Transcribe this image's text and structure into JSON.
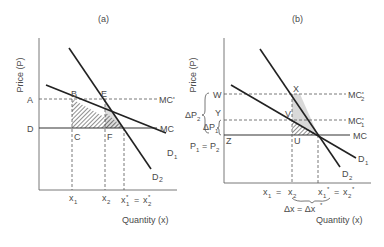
{
  "panels": [
    {
      "id": "a",
      "title": "(a)",
      "ylabel": "Price (P)",
      "xlabel": "Quantity (x)",
      "price_labels": {
        "A": "A",
        "D": "D"
      },
      "points": {
        "B": "B",
        "E": "E",
        "C": "C",
        "F": "F"
      },
      "curve_labels": {
        "mc_prime": "MC'",
        "mc": "MC",
        "d1": "D",
        "d1_sub": "1",
        "d2": "D",
        "d2_sub": "2"
      },
      "x_ticks": {
        "x1": "x",
        "x1_sub": "1",
        "x2": "x",
        "x2_sub": "2",
        "xstar": "x",
        "xstar_sub1": "1",
        "eq": "=",
        "xstar2": "x",
        "xstar_sub2": "2",
        "star": "*"
      }
    },
    {
      "id": "b",
      "title": "(b)",
      "ylabel": "Price (P)",
      "xlabel": "Quantity (x)",
      "price_labels": {
        "W": "W",
        "Y": "Y",
        "Z": "Z",
        "dp2": "ΔP",
        "dp2_sub": "2",
        "dp1": "ΔP",
        "dp1_sub": "1",
        "p1p2": "P",
        "p1p2_sub1": "1",
        "p1p2_eq": "=",
        "p1p2_2": "P",
        "p1p2_sub2": "2"
      },
      "points": {
        "X": "X",
        "V": "V",
        "U": "U"
      },
      "curve_labels": {
        "mc2_prime": "MC'",
        "mc2_sub": "2",
        "mc1_prime": "MC'",
        "mc1_sub": "1",
        "mc": "MC",
        "d1": "D",
        "d1_sub": "1",
        "d2": "D",
        "d2_sub": "2"
      },
      "x_ticks": {
        "x1": "x",
        "x1_sub": "1",
        "eq": "=",
        "x2": "x",
        "x2_sub": "2",
        "xs1": "x",
        "xs1_sub": "1",
        "star": "*",
        "eq2": "=",
        "xs2": "x",
        "xs2_sub": "2"
      },
      "delta_label": {
        "dx": "Δx = Δx",
        "star": "*"
      }
    }
  ]
}
